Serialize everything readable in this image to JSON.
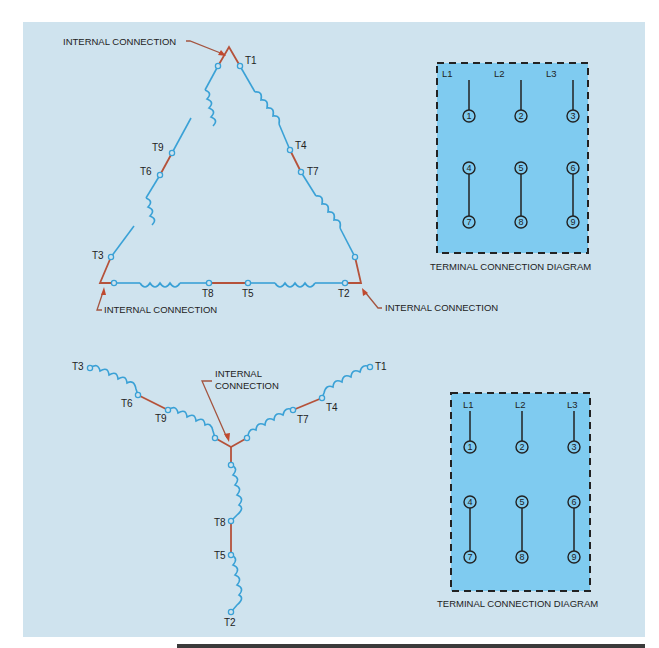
{
  "delta_diagram": {
    "title": "Delta-connected nine-lead motor",
    "internal_connection_labels": [
      "INTERNAL CONNECTION",
      "INTERNAL CONNECTION",
      "INTERNAL CONNECTION"
    ],
    "terminals": [
      "T1",
      "T2",
      "T3",
      "T4",
      "T5",
      "T6",
      "T7",
      "T8",
      "T9"
    ]
  },
  "wye_diagram": {
    "title": "Wye-connected nine-lead motor",
    "internal_connection_label_line1": "INTERNAL",
    "internal_connection_label_line2": "CONNECTION",
    "terminals": [
      "T1",
      "T2",
      "T3",
      "T4",
      "T5",
      "T6",
      "T7",
      "T8",
      "T9"
    ]
  },
  "terminal_diagram_top": {
    "caption": "TERMINAL CONNECTION DIAGRAM",
    "lines": [
      "L1",
      "L2",
      "L3"
    ],
    "row1": [
      "1",
      "2",
      "3"
    ],
    "row2": [
      "4",
      "5",
      "6"
    ],
    "row3": [
      "7",
      "8",
      "9"
    ]
  },
  "terminal_diagram_bottom": {
    "caption": "TERMINAL CONNECTION DIAGRAM",
    "lines": [
      "L1",
      "L2",
      "L3"
    ],
    "row1": [
      "1",
      "2",
      "3"
    ],
    "row2": [
      "4",
      "5",
      "6"
    ],
    "row3": [
      "7",
      "8",
      "9"
    ]
  },
  "colors": {
    "background": "#cfe3ee",
    "winding": "#3aa1d6",
    "internal_jumper": "#b5523a",
    "terminal_box_fill": "#7fcbf0",
    "ink": "#222222"
  }
}
